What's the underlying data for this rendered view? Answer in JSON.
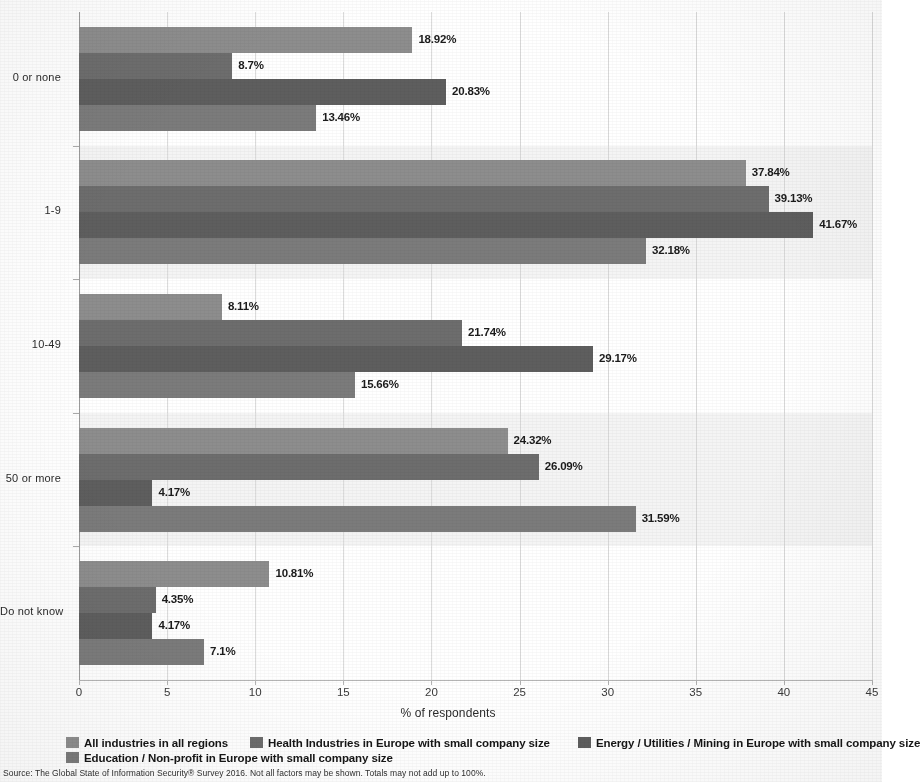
{
  "chart_data": {
    "type": "bar",
    "orientation": "horizontal",
    "title": "",
    "xlabel": "% of respondents",
    "ylabel": "",
    "xlim": [
      0,
      45
    ],
    "xticks": [
      0,
      5,
      10,
      15,
      20,
      25,
      30,
      35,
      40,
      45
    ],
    "xtick_labels": [
      "0",
      "5",
      "10",
      "15",
      "20",
      "25",
      "30",
      "35",
      "40",
      "45"
    ],
    "grid": "vertical",
    "legend_position": "bottom",
    "value_suffix": "%",
    "categories": [
      "0 or none",
      "1-9",
      "10-49",
      "50 or more",
      "Do not know"
    ],
    "series": [
      {
        "name": "All industries in all regions",
        "color": "#8d8d8d",
        "values": [
          18.92,
          37.84,
          8.11,
          24.32,
          10.81
        ],
        "labels": [
          "18.92%",
          "37.84%",
          "8.11%",
          "24.32%",
          "10.81%"
        ]
      },
      {
        "name": "Health Industries in Europe with small company size",
        "color": "#6d6d6d",
        "values": [
          8.7,
          39.13,
          21.74,
          26.09,
          4.35
        ],
        "labels": [
          "8.7%",
          "39.13%",
          "21.74%",
          "26.09%",
          "4.35%"
        ]
      },
      {
        "name": "Energy / Utilities / Mining in Europe with small company size",
        "color": "#5e5e5e",
        "values": [
          20.83,
          41.67,
          29.17,
          4.17,
          4.17
        ],
        "labels": [
          "20.83%",
          "41.67%",
          "29.17%",
          "4.17%",
          "4.17%"
        ]
      },
      {
        "name": "Education / Non-profit in Europe with small company size",
        "color": "#7b7b7b",
        "values": [
          13.46,
          32.18,
          15.66,
          31.59,
          7.1
        ],
        "labels": [
          "13.46%",
          "32.18%",
          "15.66%",
          "31.59%",
          "7.1%"
        ]
      }
    ]
  },
  "legend": {
    "items": [
      {
        "label": "All industries in all regions",
        "color": "#8d8d8d"
      },
      {
        "label": "Health Industries in Europe with small company size",
        "color": "#6d6d6d"
      },
      {
        "label": "Energy / Utilities / Mining in Europe with small company size",
        "color": "#5e5e5e"
      },
      {
        "label": "Education / Non-profit in Europe with small company size",
        "color": "#7b7b7b"
      }
    ]
  },
  "source": {
    "note": "Source: The Global State of Information Security® Survey 2016. Not all factors may be shown. Totals may not add up to 100%."
  },
  "axis": {
    "x_title": "% of respondents"
  }
}
